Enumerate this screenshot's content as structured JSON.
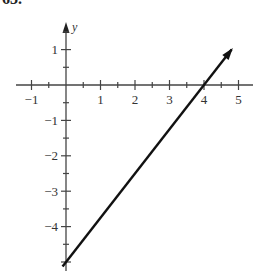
{
  "problem": {
    "number": "63."
  },
  "chart_data": {
    "type": "line",
    "title": "",
    "xlabel": "",
    "ylabel": "y",
    "xlim": [
      -1.5,
      5.3
    ],
    "ylim": [
      -5.3,
      1.8
    ],
    "xticks": [
      -1,
      1,
      2,
      3,
      4,
      5
    ],
    "yticks": [
      1,
      -1,
      -2,
      -3,
      -4
    ],
    "minor_tick_step": 0.5,
    "grid": false,
    "series": [
      {
        "name": "line",
        "equation": "y = 1.25x - 5",
        "x": [
          -0.1,
          4.8
        ],
        "y": [
          -5.125,
          1.0
        ],
        "points": [
          [
            0,
            -5
          ],
          [
            4,
            0
          ]
        ],
        "color": "#111111",
        "arrow_end": true
      }
    ]
  },
  "axis_labels": {
    "y": "y",
    "x_ticks": [
      "-1",
      "1",
      "2",
      "3",
      "4",
      "5"
    ],
    "y_ticks": [
      "1",
      "-1",
      "-2",
      "-3",
      "-4"
    ]
  }
}
